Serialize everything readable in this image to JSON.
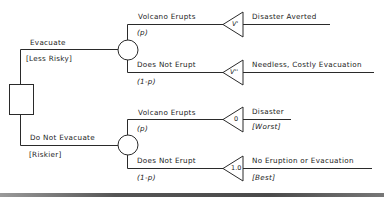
{
  "diagram": {
    "type": "decision-tree",
    "decision_node": {
      "shape": "square"
    },
    "decisions": [
      {
        "label": "Evacuate",
        "annotation": "[Less Risky]",
        "chance_node": {
          "shape": "circle"
        },
        "outcomes": [
          {
            "event": "Volcano Erupts",
            "probability": "(p)",
            "value_marker": "V'",
            "result": "Disaster Averted",
            "annotation": ""
          },
          {
            "event": "Does Not Erupt",
            "probability": "(1-p)",
            "value_marker": "V''",
            "result": "Needless, Costly Evacuation",
            "annotation": ""
          }
        ]
      },
      {
        "label": "Do Not Evacuate",
        "annotation": "[Riskier]",
        "chance_node": {
          "shape": "circle"
        },
        "outcomes": [
          {
            "event": "Volcano Erupts",
            "probability": "(p)",
            "value_marker": "0",
            "result": "Disaster",
            "annotation": "[Worst]"
          },
          {
            "event": "Does Not Erupt",
            "probability": "(1-p)",
            "value_marker": "1.0",
            "result": "No Eruption or Evacuation",
            "annotation": "[Best]"
          }
        ]
      }
    ],
    "colors": {
      "line": "#2a2a2a",
      "text": "#1a1a1a",
      "background": "#ffffff",
      "rule": "#555555"
    }
  }
}
